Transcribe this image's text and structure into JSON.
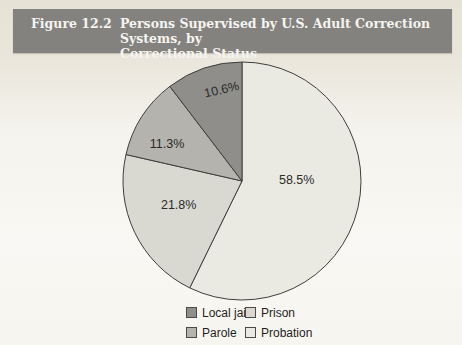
{
  "figure": {
    "label": "Figure 12.2",
    "title_line1": "Persons Supervised by U.S. Adult Correction Systems, by",
    "title_line2": "Correctional Status"
  },
  "chart_data": {
    "type": "pie",
    "title": "Persons Supervised by U.S. Adult Correction Systems, by Correctional Status",
    "unit": "percent",
    "start_angle_deg": 0,
    "direction": "clockwise",
    "slices": [
      {
        "label": "Probation",
        "value": 58.5,
        "display": "58.5%",
        "color": "#ebeae2"
      },
      {
        "label": "Prison",
        "value": 21.8,
        "display": "21.8%",
        "color": "#d9d8d1"
      },
      {
        "label": "Parole",
        "value": 11.3,
        "display": "11.3%",
        "color": "#b4b3ae"
      },
      {
        "label": "Local jail",
        "value": 10.6,
        "display": "10.6%",
        "color": "#8f8e8a"
      }
    ],
    "legend": [
      {
        "label": "Local jail",
        "color": "#8f8e8a"
      },
      {
        "label": "Prison",
        "color": "#d9d8d1"
      },
      {
        "label": "Parole",
        "color": "#b4b3ae"
      },
      {
        "label": "Probation",
        "color": "#ebeae2"
      }
    ],
    "legend_position": "bottom"
  },
  "colors": {
    "page_background_top": "#e6e2d5",
    "page_background_bottom": "#f6f5f0",
    "header_band": "#83827e",
    "header_text": "#f5f4f0",
    "slice_stroke": "#3e3e3e",
    "slice_label_text": "#2a2a2a",
    "legend_text": "#1f1f1f"
  }
}
